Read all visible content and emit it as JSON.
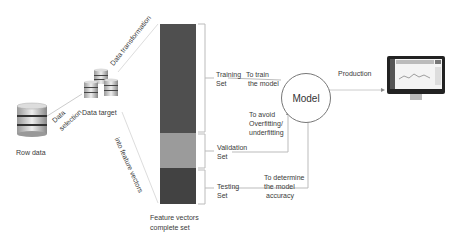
{
  "nodes": {
    "raw_data": {
      "label": "Row data",
      "icon": "database-icon"
    },
    "data_target": {
      "label": "Data target",
      "icon": "database-stack-icon"
    },
    "feature_vectors": {
      "line1": "Feature  vectors",
      "line2": "complete set"
    },
    "model": {
      "label": "Model"
    },
    "production_screen": {
      "icon": "monitor-dashboard-icon"
    }
  },
  "edges": {
    "data_selection": {
      "line1": "Data",
      "line2": "selection"
    },
    "data_transformation": {
      "label": "Data  transformation"
    },
    "into_feature_vectors": {
      "label": "into feature vectors"
    },
    "production": {
      "label": "Production"
    }
  },
  "sets": [
    {
      "name_line1": "Training",
      "name_line2": "Set",
      "purpose_line1": "To train",
      "purpose_line2": "the model",
      "color": "#505050"
    },
    {
      "name_line1": "Validation",
      "name_line2": "Set",
      "purpose_line1": "To avoid",
      "purpose_line2": "Overfitting/",
      "purpose_line3": "underfitting",
      "color": "#9a9a9a"
    },
    {
      "name_line1": "Testing",
      "name_line2": "Set",
      "purpose_line1": "To determine",
      "purpose_line2": "the model",
      "purpose_line3": "accuracy",
      "color": "#404040"
    }
  ]
}
